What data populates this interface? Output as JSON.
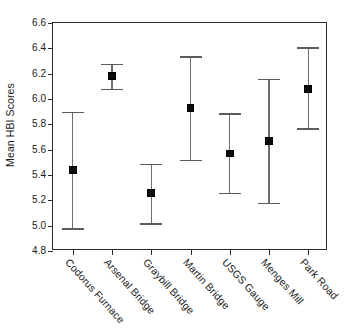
{
  "chart_data": {
    "type": "scatter",
    "title": "",
    "subtitle": "",
    "xlabel": "",
    "ylabel": "Mean HBI Scores",
    "ylim": [
      4.8,
      6.6
    ],
    "ytick_labels": [
      "4.8",
      "5.0",
      "5.2",
      "5.4",
      "5.6",
      "5.8",
      "6.0",
      "6.2",
      "6.4",
      "6.6"
    ],
    "ytick_values": [
      4.8,
      5.0,
      5.2,
      5.4,
      5.6,
      5.8,
      6.0,
      6.2,
      6.4,
      6.6
    ],
    "grid": false,
    "legend": "none",
    "error_style": "capped-vertical-error-bars",
    "marker": "filled-square",
    "categories": [
      "Codorus Furnace",
      "Arsenal Bridge",
      "Graybill Bridge",
      "Martin Bridge",
      "USGS Gauge",
      "Menges Mill",
      "Park Road"
    ],
    "series": [
      {
        "name": "Mean HBI Scores",
        "values": [
          5.44,
          6.18,
          5.26,
          5.93,
          5.57,
          5.67,
          6.08
        ],
        "upper": [
          5.9,
          6.28,
          5.49,
          6.34,
          5.89,
          6.16,
          6.41
        ],
        "lower": [
          4.98,
          6.08,
          5.02,
          5.52,
          5.26,
          5.18,
          5.77
        ]
      }
    ],
    "points": [
      {
        "category": "Codorus Furnace",
        "mean": 5.44,
        "upper": 5.9,
        "lower": 4.98
      },
      {
        "category": "Arsenal Bridge",
        "mean": 6.18,
        "upper": 6.28,
        "lower": 6.08
      },
      {
        "category": "Graybill Bridge",
        "mean": 5.26,
        "upper": 5.49,
        "lower": 5.02
      },
      {
        "category": "Martin Bridge",
        "mean": 5.93,
        "upper": 6.34,
        "lower": 5.52
      },
      {
        "category": "USGS Gauge",
        "mean": 5.57,
        "upper": 5.89,
        "lower": 5.26
      },
      {
        "category": "Menges Mill",
        "mean": 5.67,
        "upper": 6.16,
        "lower": 5.18
      },
      {
        "category": "Park Road",
        "mean": 6.08,
        "upper": 6.41,
        "lower": 5.77
      }
    ],
    "colors": {
      "marker": "#0d0d0d",
      "error_line": "#6e6e6e",
      "axis": "#2b2b2b",
      "text": "#1b1b1b",
      "background": "#ffffff"
    }
  }
}
